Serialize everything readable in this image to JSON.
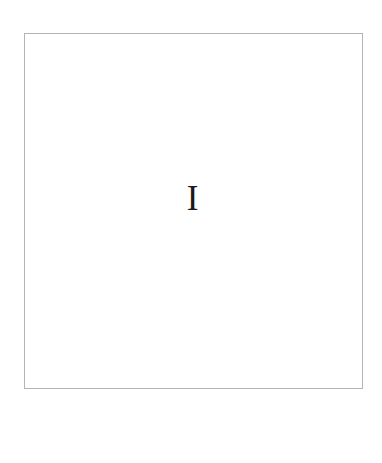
{
  "page": {
    "background_color": "#ffffff",
    "width": 382,
    "height": 463
  },
  "frame": {
    "border_color": "#b4b4b4",
    "border_width": 1,
    "fill_color": "#ffffff",
    "x": 24,
    "y": 33,
    "width": 339,
    "height": 356
  },
  "content": {
    "glyph": "I",
    "glyph_name": "capital-letter-i",
    "color": "#1a1a1a",
    "font_style": "serif",
    "cap_height_px": 25,
    "center_x": 192,
    "top_y": 200,
    "bottom_y": 225
  },
  "margins": {
    "top_label": "",
    "bottom_label": "",
    "left_label": "",
    "right_label": ""
  }
}
